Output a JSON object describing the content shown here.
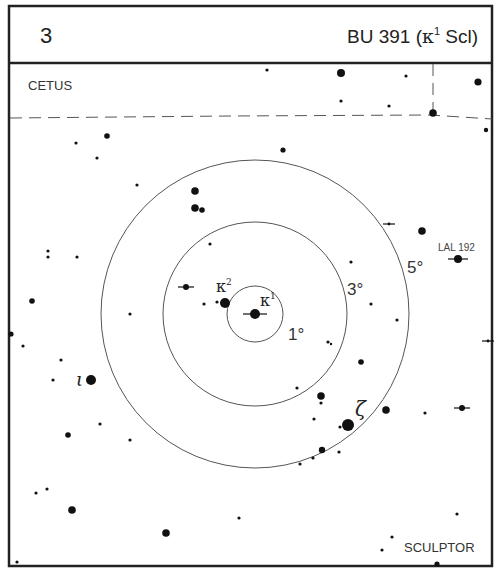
{
  "header": {
    "chart_number": "3",
    "title_prefix": "BU 391 (",
    "title_greek": "κ",
    "title_sup": "1",
    "title_suffix": " Scl)"
  },
  "constellations": {
    "top_left": "CETUS",
    "bottom_right": "SCULPTOR"
  },
  "rings": [
    {
      "label": "1°",
      "radius": 28
    },
    {
      "label": "3°",
      "radius": 92
    },
    {
      "label": "5°",
      "radius": 154
    }
  ],
  "ring_center": {
    "x": 255,
    "y": 314
  },
  "labels": {
    "kappa1": {
      "greek": "κ",
      "sup": "1"
    },
    "kappa2": {
      "greek": "κ",
      "sup": "2"
    },
    "iota": "ι",
    "zeta": "ζ",
    "lal192": "LAL 192"
  },
  "stars": [
    {
      "x": 267,
      "y": 70,
      "r": 1.6
    },
    {
      "x": 341,
      "y": 73,
      "r": 4
    },
    {
      "x": 406,
      "y": 76,
      "r": 1.6
    },
    {
      "x": 478,
      "y": 82,
      "r": 3.6
    },
    {
      "x": 341,
      "y": 101,
      "r": 1.6
    },
    {
      "x": 389,
      "y": 106,
      "r": 1.6
    },
    {
      "x": 433,
      "y": 113,
      "r": 3.8
    },
    {
      "x": 486,
      "y": 130,
      "r": 2.2
    },
    {
      "x": 107,
      "y": 136,
      "r": 2.8
    },
    {
      "x": 76,
      "y": 143,
      "r": 1.6
    },
    {
      "x": 97,
      "y": 158,
      "r": 1.6
    },
    {
      "x": 283,
      "y": 150,
      "r": 2.6
    },
    {
      "x": 137,
      "y": 185,
      "r": 1.6
    },
    {
      "x": 195,
      "y": 191,
      "r": 3.8
    },
    {
      "x": 195,
      "y": 208,
      "r": 3.8
    },
    {
      "x": 202,
      "y": 210,
      "r": 2.8
    },
    {
      "x": 210,
      "y": 244,
      "r": 1.6
    },
    {
      "x": 422,
      "y": 231,
      "r": 3.8
    },
    {
      "x": 48,
      "y": 251,
      "r": 1.6
    },
    {
      "x": 48,
      "y": 257,
      "r": 1.6
    },
    {
      "x": 77,
      "y": 257,
      "r": 1.6
    },
    {
      "x": 351,
      "y": 262,
      "r": 1.6
    },
    {
      "x": 32,
      "y": 301,
      "r": 2.8
    },
    {
      "x": 204,
      "y": 304,
      "r": 1.6
    },
    {
      "x": 217,
      "y": 302,
      "r": 1.6
    },
    {
      "x": 130,
      "y": 314,
      "r": 1.6
    },
    {
      "x": 371,
      "y": 304,
      "r": 1.6
    },
    {
      "x": 397,
      "y": 320,
      "r": 1.6
    },
    {
      "x": 11,
      "y": 334,
      "r": 2.6
    },
    {
      "x": 23,
      "y": 346,
      "r": 1.6
    },
    {
      "x": 328,
      "y": 342,
      "r": 1.6
    },
    {
      "x": 331,
      "y": 344,
      "r": 1.2
    },
    {
      "x": 61,
      "y": 360,
      "r": 1.6
    },
    {
      "x": 53,
      "y": 380,
      "r": 1.6
    },
    {
      "x": 361,
      "y": 362,
      "r": 2.8
    },
    {
      "x": 100,
      "y": 424,
      "r": 1.6
    },
    {
      "x": 68,
      "y": 435,
      "r": 2.8
    },
    {
      "x": 130,
      "y": 440,
      "r": 1.6
    },
    {
      "x": 297,
      "y": 388,
      "r": 1.6
    },
    {
      "x": 321,
      "y": 396,
      "r": 3.8
    },
    {
      "x": 321,
      "y": 403,
      "r": 1.6
    },
    {
      "x": 314,
      "y": 419,
      "r": 1.6
    },
    {
      "x": 386,
      "y": 410,
      "r": 3.8
    },
    {
      "x": 425,
      "y": 413,
      "r": 1.6
    },
    {
      "x": 340,
      "y": 427,
      "r": 1.6
    },
    {
      "x": 322,
      "y": 450,
      "r": 3.2
    },
    {
      "x": 339,
      "y": 452,
      "r": 1.6
    },
    {
      "x": 313,
      "y": 458,
      "r": 1.6
    },
    {
      "x": 300,
      "y": 464,
      "r": 1.6
    },
    {
      "x": 36,
      "y": 493,
      "r": 1.6
    },
    {
      "x": 47,
      "y": 489,
      "r": 1.6
    },
    {
      "x": 72,
      "y": 510,
      "r": 3.8
    },
    {
      "x": 166,
      "y": 533,
      "r": 3.8
    },
    {
      "x": 239,
      "y": 518,
      "r": 1.6
    },
    {
      "x": 457,
      "y": 514,
      "r": 1.6
    },
    {
      "x": 392,
      "y": 537,
      "r": 1.6
    },
    {
      "x": 382,
      "y": 550,
      "r": 1.6
    },
    {
      "x": 17,
      "y": 562,
      "r": 1.6
    },
    {
      "x": 437,
      "y": 564,
      "r": 2.6
    }
  ],
  "named_stars": [
    {
      "id": "kappa1",
      "x": 255,
      "y": 314,
      "r": 5
    },
    {
      "id": "kappa2",
      "x": 225,
      "y": 303,
      "r": 5
    },
    {
      "id": "iota",
      "x": 91,
      "y": 380,
      "r": 5
    },
    {
      "id": "zeta",
      "x": 348,
      "y": 425,
      "r": 6
    },
    {
      "id": "lal192",
      "x": 458,
      "y": 259,
      "r": 4
    }
  ],
  "double_markers": [
    {
      "x": 255,
      "y": 314,
      "len": 12
    },
    {
      "x": 186,
      "y": 287,
      "len": 8,
      "r": 3
    },
    {
      "x": 458,
      "y": 259,
      "len": 10
    },
    {
      "x": 389,
      "y": 224,
      "len": 6,
      "r": 1.4
    },
    {
      "x": 488,
      "y": 341,
      "len": 6,
      "r": 1.4
    },
    {
      "x": 462,
      "y": 408,
      "len": 8,
      "r": 3
    }
  ],
  "boundary": {
    "dashed_line": [
      [
        10,
        118
      ],
      [
        230,
        116
      ],
      [
        430,
        115
      ],
      [
        492,
        119
      ]
    ],
    "dashed_vertical": [
      [
        433,
        64
      ],
      [
        433,
        113
      ]
    ]
  }
}
